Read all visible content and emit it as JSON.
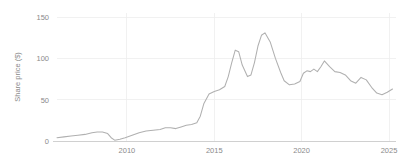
{
  "chart_data": {
    "type": "line",
    "title": "",
    "subtitle": "",
    "xlabel": "",
    "ylabel": "Share price ($)",
    "xlim": [
      2006.0,
      2025.4
    ],
    "ylim": [
      0,
      155
    ],
    "xticks": [
      2010,
      2015,
      2020,
      2025
    ],
    "xtick_labels": [
      "2010",
      "2015",
      "2020",
      "2025"
    ],
    "yticks": [
      0,
      50,
      100,
      150
    ],
    "ytick_labels": [
      "0",
      "50",
      "100",
      "150"
    ],
    "grid": "both-faint",
    "legend": "none",
    "line_color": "#b0b0b0",
    "grid_color": "#ededed",
    "axis_color": "#cccccc",
    "text_color": "#8a8a8a",
    "background": "#ffffff",
    "series": [
      {
        "name": "Share price",
        "x": [
          2006.0,
          2006.4,
          2006.8,
          2007.2,
          2007.6,
          2008.0,
          2008.3,
          2008.6,
          2008.9,
          2009.1,
          2009.3,
          2009.6,
          2009.9,
          2010.3,
          2010.7,
          2011.1,
          2011.5,
          2011.9,
          2012.2,
          2012.5,
          2012.8,
          2013.1,
          2013.4,
          2013.7,
          2014.0,
          2014.2,
          2014.4,
          2014.7,
          2015.0,
          2015.3,
          2015.6,
          2015.8,
          2016.0,
          2016.2,
          2016.4,
          2016.6,
          2016.9,
          2017.1,
          2017.3,
          2017.5,
          2017.7,
          2017.9,
          2018.2,
          2018.5,
          2018.8,
          2019.0,
          2019.3,
          2019.6,
          2019.9,
          2020.1,
          2020.3,
          2020.5,
          2020.7,
          2020.9,
          2021.1,
          2021.3,
          2021.6,
          2021.9,
          2022.2,
          2022.5,
          2022.8,
          2023.1,
          2023.4,
          2023.7,
          2024.0,
          2024.3,
          2024.6,
          2024.9,
          2025.2
        ],
        "y": [
          4,
          5,
          6,
          7,
          8,
          10,
          11,
          11,
          9,
          4,
          1,
          2,
          4,
          7,
          10,
          12,
          13,
          14,
          16,
          16,
          15,
          17,
          19,
          20,
          22,
          30,
          45,
          57,
          60,
          62,
          66,
          78,
          95,
          110,
          108,
          92,
          78,
          80,
          95,
          115,
          128,
          131,
          120,
          100,
          83,
          73,
          68,
          69,
          72,
          82,
          85,
          84,
          87,
          84,
          90,
          97,
          90,
          84,
          83,
          80,
          73,
          70,
          77,
          74,
          65,
          58,
          56,
          59,
          63
        ]
      }
    ]
  },
  "axis": {
    "ylabel": "Share price ($)"
  }
}
